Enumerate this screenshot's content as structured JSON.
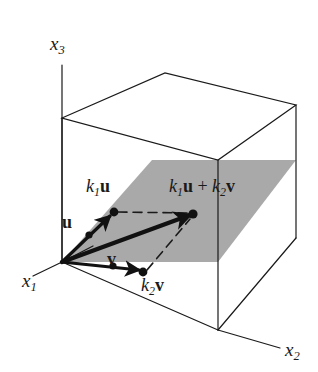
{
  "figure": {
    "type": "vector-diagram",
    "background_color": "#ffffff",
    "line_color": "#1a1a1a",
    "plane_fill_color": "#a8a8a8",
    "axes": [
      {
        "name": "x3",
        "label_base": "x",
        "label_sub": "3",
        "position": {
          "x": 50,
          "y": 30
        }
      },
      {
        "name": "x1",
        "label_base": "x",
        "label_sub": "1",
        "position": {
          "x": 22,
          "y": 272
        }
      },
      {
        "name": "x2",
        "label_base": "x",
        "label_sub": "2",
        "position": {
          "x": 286,
          "y": 341
        }
      }
    ],
    "labels": {
      "u": {
        "base": "",
        "bold": "u",
        "x": 62,
        "y": 213
      },
      "v": {
        "base": "",
        "bold": "v",
        "x": 106,
        "y": 250
      },
      "k1u": {
        "base": "k",
        "sub": "1",
        "bold": "u",
        "x": 86,
        "y": 178
      },
      "k2v": {
        "base": "k",
        "sub": "2",
        "bold": "v",
        "x": 141,
        "y": 277
      },
      "k1u_plus_k2v": {
        "base": "k",
        "sub": "1",
        "bold": "u",
        "plus": " + ",
        "base2": "k",
        "sub2": "2",
        "bold2": "v",
        "x": 170,
        "y": 178
      }
    },
    "points": {
      "origin": {
        "x": 62,
        "y": 262
      },
      "u_tip": {
        "x": 89,
        "y": 234
      },
      "k1u_tip": {
        "x": 114,
        "y": 212
      },
      "v_tip": {
        "x": 113,
        "y": 265
      },
      "k2v_tip": {
        "x": 143,
        "y": 272
      },
      "sum_tip": {
        "x": 193,
        "y": 214
      }
    },
    "box_corners": {
      "top_back_left": {
        "x": 62,
        "y": 118
      },
      "top_back_center": {
        "x": 165,
        "y": 73
      },
      "top_back_right": {
        "x": 296,
        "y": 105
      },
      "top_front": {
        "x": 218,
        "y": 160
      },
      "bottom_front": {
        "x": 218,
        "y": 330
      },
      "bottom_left": {
        "x": 62,
        "y": 262
      },
      "bottom_right": {
        "x": 296,
        "y": 238
      }
    }
  }
}
